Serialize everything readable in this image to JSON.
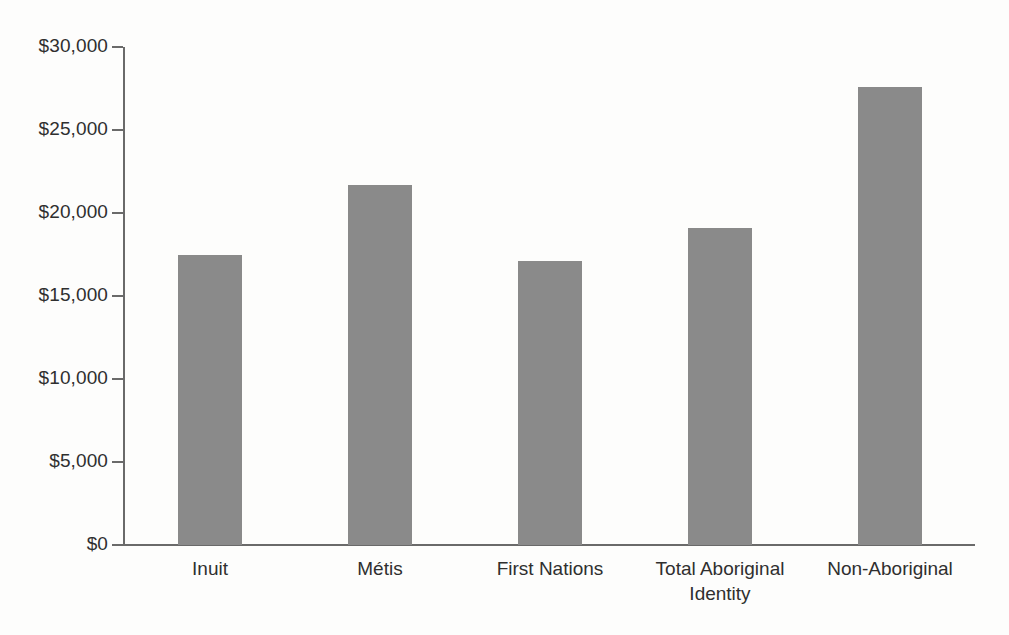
{
  "chart_data": {
    "type": "bar",
    "title": "",
    "subtitle": "",
    "xlabel": "",
    "ylabel": "",
    "categories": [
      "Inuit",
      "Métis",
      "First Nations",
      "Total Aboriginal\nIdentity",
      "Non-Aboriginal"
    ],
    "values": [
      17500,
      21700,
      17100,
      19100,
      27600
    ],
    "ylim": [
      0,
      30000
    ],
    "ytick_values": [
      0,
      5000,
      10000,
      15000,
      20000,
      25000,
      30000
    ],
    "ytick_labels": [
      "$0",
      "$5,000",
      "$10,000",
      "$15,000",
      "$20,000",
      "$25,000",
      "$30,000"
    ],
    "grid": false,
    "legend": false,
    "legend_position": "none",
    "orientation": "vertical",
    "bar_color": "#8a8a8a",
    "axis_color": "#6a6a6a",
    "text_color": "#2f2f2f",
    "background_color": "#fdfdfc"
  }
}
